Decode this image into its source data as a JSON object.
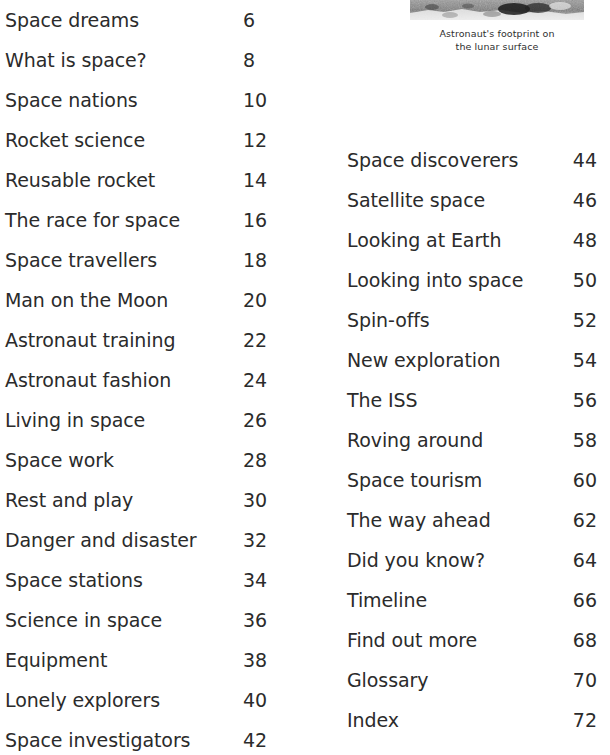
{
  "figure": {
    "image_name": "lunar-footprint-photo",
    "image_alt": "Black and white photograph of the rocky lunar surface",
    "caption_line_1": "Astronaut's footprint on",
    "caption_line_2": "the lunar surface"
  },
  "colors": {
    "text": "#2b2b2b",
    "background": "#ffffff",
    "caption": "#2f2f2f"
  },
  "contents": {
    "left_column": [
      {
        "title": "Space dreams",
        "page": "6"
      },
      {
        "title": "What is space?",
        "page": "8"
      },
      {
        "title": "Space nations",
        "page": "10"
      },
      {
        "title": "Rocket science",
        "page": "12"
      },
      {
        "title": "Reusable rocket",
        "page": "14"
      },
      {
        "title": "The race for space",
        "page": "16"
      },
      {
        "title": "Space travellers",
        "page": "18"
      },
      {
        "title": "Man on the Moon",
        "page": "20"
      },
      {
        "title": "Astronaut training",
        "page": "22"
      },
      {
        "title": "Astronaut fashion",
        "page": "24"
      },
      {
        "title": "Living in space",
        "page": "26"
      },
      {
        "title": "Space work",
        "page": "28"
      },
      {
        "title": "Rest and play",
        "page": "30"
      },
      {
        "title": "Danger and disaster",
        "page": "32"
      },
      {
        "title": "Space stations",
        "page": "34"
      },
      {
        "title": "Science in space",
        "page": "36"
      },
      {
        "title": "Equipment",
        "page": "38"
      },
      {
        "title": "Lonely explorers",
        "page": "40"
      },
      {
        "title": "Space investigators",
        "page": "42"
      }
    ],
    "right_column": [
      {
        "title": "Space discoverers",
        "page": "44"
      },
      {
        "title": "Satellite space",
        "page": "46"
      },
      {
        "title": "Looking at Earth",
        "page": "48"
      },
      {
        "title": "Looking into space",
        "page": "50"
      },
      {
        "title": "Spin-offs",
        "page": "52"
      },
      {
        "title": "New exploration",
        "page": "54"
      },
      {
        "title": "The ISS",
        "page": "56"
      },
      {
        "title": "Roving around",
        "page": "58"
      },
      {
        "title": "Space tourism",
        "page": "60"
      },
      {
        "title": "The way ahead",
        "page": "62"
      },
      {
        "title": "Did you know?",
        "page": "64"
      },
      {
        "title": "Timeline",
        "page": "66"
      },
      {
        "title": "Find out more",
        "page": "68"
      },
      {
        "title": "Glossary",
        "page": "70"
      },
      {
        "title": "Index",
        "page": "72"
      }
    ]
  }
}
